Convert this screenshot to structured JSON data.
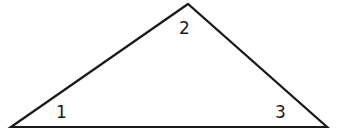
{
  "diagram": {
    "type": "triangle",
    "stroke_color": "#1a1a1a",
    "background": "#ffffff",
    "vertices": {
      "left": {
        "x": 11,
        "y": 127
      },
      "top": {
        "x": 188,
        "y": 4
      },
      "right": {
        "x": 327,
        "y": 127
      }
    },
    "angle_labels": [
      {
        "id": "1",
        "text": "1",
        "vertex": "left"
      },
      {
        "id": "2",
        "text": "2",
        "vertex": "top"
      },
      {
        "id": "3",
        "text": "3",
        "vertex": "right"
      }
    ]
  }
}
